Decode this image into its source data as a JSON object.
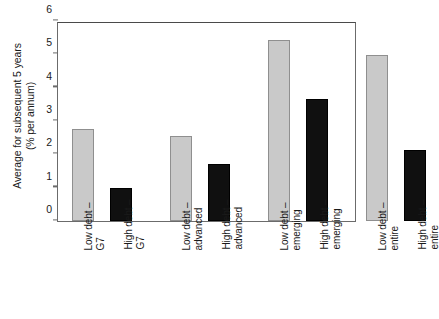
{
  "chart_data": {
    "type": "bar",
    "title": "",
    "xlabel": "",
    "ylabel": "Average for subsequent 5 years\n(% per annum)",
    "ylabel_line1": "Average for subsequent 5 years",
    "ylabel_line2": "(% per annum)",
    "ylim": [
      0,
      6
    ],
    "yticks": [
      0,
      1,
      2,
      3,
      4,
      5,
      6
    ],
    "ytick_labels": [
      "0",
      "1",
      "2",
      "3",
      "4",
      "5",
      "6"
    ],
    "grid": false,
    "legend": "none",
    "categories": [
      "Low debt – G7",
      "High debt – G7",
      "Low debt – advanced",
      "High debt – advanced",
      "Low debt – emerging",
      "High debt – emerging",
      "Low debt – entire",
      "High debt – entire"
    ],
    "category_lines": [
      [
        "Low debt –",
        "G7"
      ],
      [
        "High debt –",
        "G7"
      ],
      [
        "Low debt –",
        "advanced"
      ],
      [
        "High debt –",
        "advanced"
      ],
      [
        "Low debt –",
        "emerging"
      ],
      [
        "High debt –",
        "emerging"
      ],
      [
        "Low debt –",
        "entire"
      ],
      [
        "High debt –",
        "entire"
      ]
    ],
    "values": [
      2.75,
      0.99,
      2.55,
      1.71,
      5.43,
      3.65,
      4.97,
      2.12
    ],
    "bar_colors": [
      "#c9c9c9",
      "#101010",
      "#c9c9c9",
      "#101010",
      "#c9c9c9",
      "#101010",
      "#c9c9c9",
      "#101010"
    ],
    "bar_styles": [
      "light",
      "dark",
      "light",
      "dark",
      "light",
      "dark",
      "light",
      "dark"
    ],
    "groups": [
      "G7",
      "advanced",
      "emerging",
      "entire"
    ]
  },
  "colors": {
    "light_bar": "#c9c9c9",
    "light_bar_border": "#8f8f8f",
    "dark_bar": "#101010",
    "axis": "#6b6b6b",
    "text": "#1a1a1a",
    "background": "#ffffff"
  }
}
